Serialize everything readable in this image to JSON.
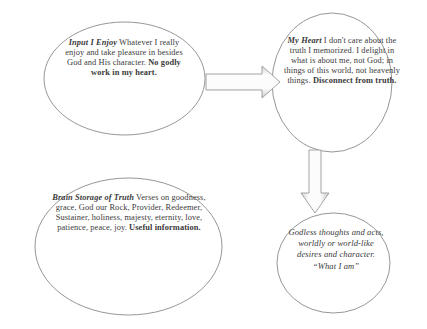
{
  "diagram": {
    "background_color": "#ffffff",
    "outline_color": "#8a8a8a",
    "text_color": "#3a3a3a",
    "nodes": [
      {
        "id": "input-i-enjoy",
        "shape": "ellipse",
        "lead": "Input I Enjoy",
        "body": " Whatever I really enjoy and take pleasure in besides God and His character. ",
        "emphasis": "No godly work in my heart."
      },
      {
        "id": "my-heart",
        "shape": "circle",
        "lead": "My Heart",
        "body": " I don't care about the truth I memorized. I delight in what is about me, not God; in things of this world, not heavenly things. ",
        "emphasis": "Disconnect from truth."
      },
      {
        "id": "brain-storage-of-truth",
        "shape": "ellipse",
        "lead": "Brain Storage of Truth",
        "body": " Verses on goodness, grace, God our Rock, Provider, Redeemer, Sustainer, holiness, majesty, eternity, love, patience, peace, joy. ",
        "emphasis": "Useful information."
      },
      {
        "id": "godless-thoughts",
        "shape": "ellipse",
        "lead": "",
        "body": "Godless thoughts and acts, worldly or world-like desires and character. “What I am”",
        "emphasis": ""
      }
    ],
    "arrows": [
      {
        "id": "arrow-input-to-heart",
        "direction": "right",
        "from": "input-i-enjoy",
        "to": "my-heart",
        "fill_color": "#f4f4f4",
        "stroke_color": "#9a9a9a"
      },
      {
        "id": "arrow-heart-to-godless",
        "direction": "down",
        "from": "my-heart",
        "to": "godless-thoughts",
        "fill_color": "#f4f4f4",
        "stroke_color": "#9a9a9a"
      }
    ]
  }
}
